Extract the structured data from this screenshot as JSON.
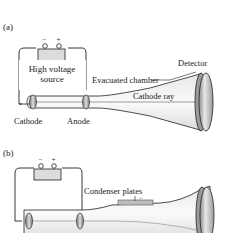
{
  "panels": [
    {
      "id": "a",
      "tag": "(a)",
      "source_label_line1": "High voltage",
      "source_label_line2": "source",
      "labels": {
        "chamber": "Evacuated chamber",
        "detector": "Detector",
        "ray": "Cathode ray",
        "cathode": "Cathode",
        "anode": "Anode"
      },
      "terminals": {
        "negative": "−",
        "positive": "+"
      }
    },
    {
      "id": "b",
      "tag": "(b)",
      "labels": {
        "plates": "Condenser plates",
        "plate_sign": "−"
      },
      "terminals": {
        "negative": "−",
        "positive": "+"
      }
    }
  ],
  "colors": {
    "line": "#222222",
    "tube_fill": "#f2f2f2",
    "tube_shade": "#d9d9d9",
    "battery_fill": "#dcdcdc",
    "plate_fill": "#bdbdbd",
    "ray": "#9a9a9a"
  }
}
